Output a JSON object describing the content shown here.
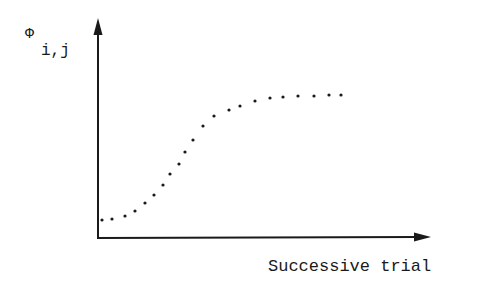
{
  "chart_data": {
    "type": "scatter",
    "title": "",
    "xlabel": "Successive trial",
    "ylabel": "Φ",
    "ylabel_subscript": "i,j",
    "grid": false,
    "legend": null,
    "ticks": false,
    "xlim": [
      0,
      1
    ],
    "ylim": [
      0,
      1
    ],
    "series": [
      {
        "name": "phi_ij",
        "style": "dotted",
        "x": [
          0.01,
          0.04,
          0.08,
          0.11,
          0.14,
          0.17,
          0.2,
          0.22,
          0.25,
          0.27,
          0.29,
          0.32,
          0.35,
          0.39,
          0.43,
          0.46,
          0.51,
          0.56,
          0.6,
          0.65,
          0.7,
          0.75,
          0.74
        ],
        "y": [
          0.08,
          0.09,
          0.11,
          0.13,
          0.17,
          0.21,
          0.26,
          0.31,
          0.36,
          0.42,
          0.47,
          0.54,
          0.59,
          0.61,
          0.63,
          0.66,
          0.67,
          0.68,
          0.69,
          0.69,
          0.7,
          0.7,
          0.7
        ]
      }
    ]
  },
  "pixel_points": [
    [
      102,
      220
    ],
    [
      112,
      219
    ],
    [
      125,
      216
    ],
    [
      135,
      211
    ],
    [
      145,
      203
    ],
    [
      154,
      195
    ],
    [
      163,
      185
    ],
    [
      170,
      174
    ],
    [
      179,
      164
    ],
    [
      185,
      152
    ],
    [
      193,
      140
    ],
    [
      203,
      126
    ],
    [
      214,
      116
    ],
    [
      229,
      110
    ],
    [
      240,
      106
    ],
    [
      255,
      101
    ],
    [
      270,
      98
    ],
    [
      283,
      97
    ],
    [
      298,
      96
    ],
    [
      314,
      96
    ],
    [
      329,
      95
    ],
    [
      341,
      95
    ]
  ],
  "labels": {
    "y_symbol": "Φ",
    "y_subscript": "i,j",
    "x_axis": "Successive trial"
  }
}
